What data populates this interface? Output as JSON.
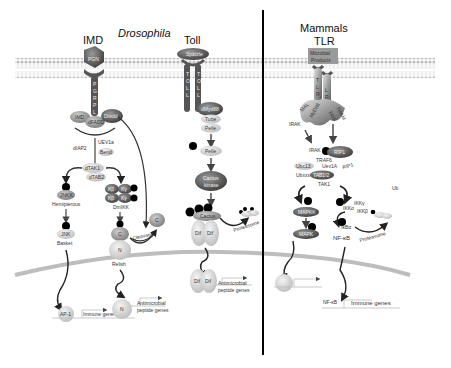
{
  "titles": {
    "imd": "IMD",
    "drosophila": "Drosophila",
    "toll": "Toll",
    "mammals": "Mammals",
    "tlr": "TLR"
  },
  "imd_pathway": {
    "receptor_ligand": "PGN",
    "receptor": [
      "P",
      "G",
      "R",
      "P",
      "L"
    ],
    "adaptors": [
      "IMD",
      "dFADD",
      "Dredd"
    ],
    "diap2": "dIAP2",
    "uev": [
      "UEV1a",
      "Bend"
    ],
    "tak": [
      "dTAK1",
      "dTAB2"
    ],
    "jnk_branch": {
      "kinase1": "JNKK",
      "kinase1_label": "Hemipterous",
      "kinase2": "JNK",
      "kinase2_label": "Basket",
      "tf": "AP-1",
      "genes": "Immune genes"
    },
    "ikk": {
      "subunits": [
        "Kβ",
        "Kγ",
        "Kβ",
        "Kγ"
      ],
      "label": "DmIKK"
    },
    "relish": {
      "c": "C",
      "n": "N",
      "label": "Relish",
      "cleaved": "C",
      "cleavage": "Cleavage"
    },
    "nuclear": {
      "n": "N",
      "genes_line1": "Antimicrobial",
      "genes_line2": "peptide genes"
    }
  },
  "toll_pathway": {
    "ligand": "Spätzle",
    "receptor": [
      "T",
      "O",
      "L",
      "L"
    ],
    "adaptors": [
      "dMyd88",
      "Tube",
      "Pelle"
    ],
    "pelle": "Pelle",
    "cactus_kinase_line1": "Cactus",
    "cactus_kinase_line2": "kinase",
    "cactus": "Cactus",
    "dif": [
      "Dif",
      "Dif"
    ],
    "proteasome": "Proteasome",
    "nuclear_dif": [
      "Dif",
      "Dif"
    ],
    "genes_line1": "Antimicrobial",
    "genes_line2": "peptide genes"
  },
  "tlr_pathway": {
    "ligand_line1": "Microbial",
    "ligand_line2": "Products",
    "receptor": [
      "T",
      "L",
      "R"
    ],
    "adaptors": [
      "MAL",
      "MyD88",
      "TRIF",
      "TRAM"
    ],
    "irak_left": "IRAK",
    "irak": "IRAK",
    "traf": "TRAF6",
    "ubc13": "Ubc13",
    "uev1a": "Uev1A",
    "rip1": "RIP1",
    "ubcx": "Ubxxx",
    "tab": "TAB1/2",
    "tak1": "TAK1",
    "mapkk": "MAPKK",
    "mapk": "MAPK",
    "ikk_labels": [
      "IKKγ",
      "IKKα",
      "IKKβ"
    ],
    "ikb": "IκBα",
    "nfkb": "NF-κB",
    "proteasome": "Proteasome",
    "ub": "Ub",
    "nuclear_nfkb": "NF-κB",
    "genes": "Immune genes"
  },
  "colors": {
    "membrane": "#c9c9c9",
    "dark_protein": "#5a5a5a",
    "mid_protein": "#8a8a8a",
    "light_protein": "#cfcfcf",
    "phospho": "#000000",
    "divider": "#000000",
    "nucleus": "#bdbdbd"
  }
}
